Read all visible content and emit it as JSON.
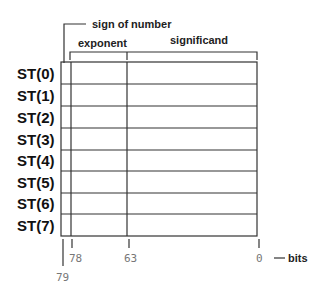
{
  "diagram": {
    "title_annotations": {
      "sign": "sign of number",
      "exponent": "exponent",
      "significand": "significand"
    },
    "registers": [
      "ST(0)",
      "ST(1)",
      "ST(2)",
      "ST(3)",
      "ST(4)",
      "ST(5)",
      "ST(6)",
      "ST(7)"
    ],
    "bit_positions": {
      "b79": "79",
      "b78": "78",
      "b63": "63",
      "b0": "0",
      "unit": "bits"
    },
    "colors": {
      "line": "#333333",
      "label": "#111111",
      "bit_label": "#777777"
    }
  }
}
